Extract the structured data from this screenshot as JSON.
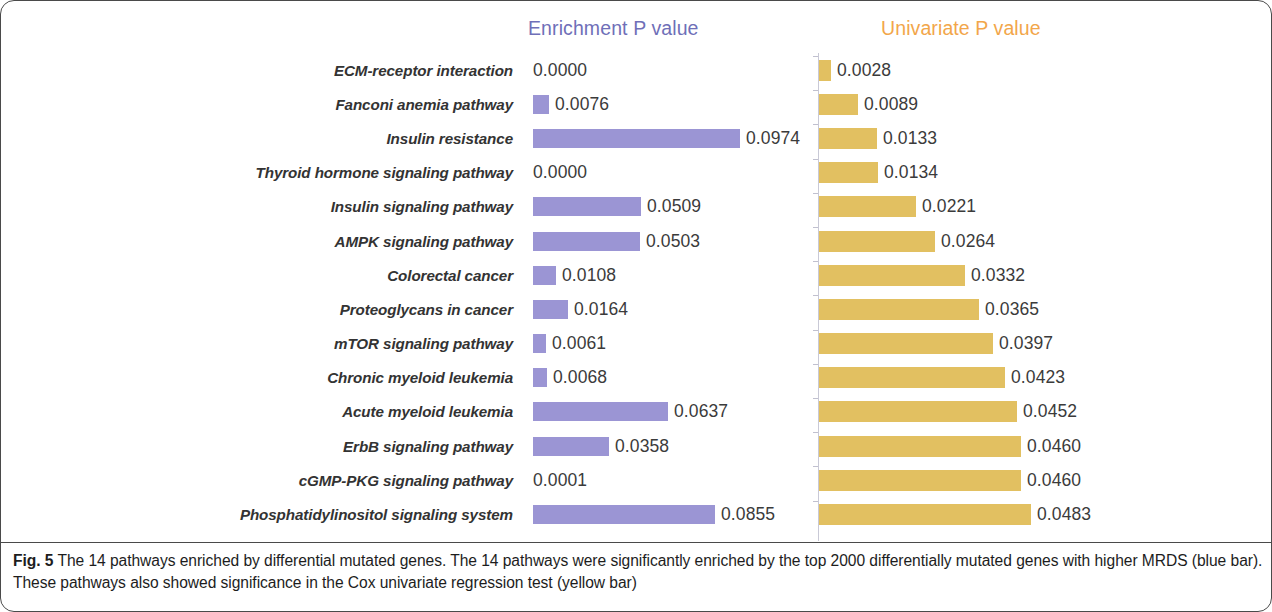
{
  "figure": {
    "number_label": "Fig. 5",
    "caption": " The 14 pathways enriched by differential mutated genes. The 14 pathways were significantly enriched by the top 2000 differentially mutated genes with higher MRDS (blue bar). These pathways also showed significance in the Cox univariate regression test (yellow bar)"
  },
  "colors": {
    "enrichment_bar": "#9b95d4",
    "enrichment_title": "#6f6fb8",
    "univariate_bar": "#e2c061",
    "univariate_title": "#f2a64a",
    "label_text": "#333333",
    "value_text": "#3b3b3b",
    "border": "#4a4a4a"
  },
  "chart_data": {
    "type": "bar",
    "title": "",
    "subtitle": "",
    "orientation": "horizontal",
    "grid": false,
    "legend_position": "top",
    "xlabel": "",
    "ylabel": "",
    "categories": [
      "ECM-receptor interaction",
      "Fanconi anemia pathway",
      "Insulin resistance",
      "Thyroid hormone signaling pathway",
      "Insulin signaling pathway",
      "AMPK signaling pathway",
      "Colorectal cancer",
      "Proteoglycans in cancer",
      "mTOR signaling pathway",
      "Chronic myeloid leukemia",
      "Acute myeloid leukemia",
      "ErbB signaling pathway",
      "cGMP-PKG signaling pathway",
      "Phosphatidylinositol signaling system"
    ],
    "series": [
      {
        "name": "Enrichment P value",
        "color": "#9b95d4",
        "values": [
          0.0,
          0.0076,
          0.0974,
          0.0,
          0.0509,
          0.0503,
          0.0108,
          0.0164,
          0.0061,
          0.0068,
          0.0637,
          0.0358,
          0.0001,
          0.0855
        ],
        "labels": [
          "0.0000",
          "0.0076",
          "0.0974",
          "0.0000",
          "0.0509",
          "0.0503",
          "0.0108",
          "0.0164",
          "0.0061",
          "0.0068",
          "0.0637",
          "0.0358",
          "0.0001",
          "0.0855"
        ],
        "xlim": [
          0,
          0.0974
        ]
      },
      {
        "name": "Univariate P value",
        "color": "#e2c061",
        "values": [
          0.0028,
          0.0089,
          0.0133,
          0.0134,
          0.0221,
          0.0264,
          0.0332,
          0.0365,
          0.0397,
          0.0423,
          0.0452,
          0.046,
          0.046,
          0.0483
        ],
        "labels": [
          "0.0028",
          "0.0089",
          "0.0133",
          "0.0134",
          "0.0221",
          "0.0264",
          "0.0332",
          "0.0365",
          "0.0397",
          "0.0423",
          "0.0452",
          "0.0460",
          "0.0460",
          "0.0483"
        ],
        "xlim": [
          0,
          0.0483
        ]
      }
    ]
  },
  "headers": {
    "enrichment": "Enrichment P value",
    "univariate": "Univariate P value"
  }
}
